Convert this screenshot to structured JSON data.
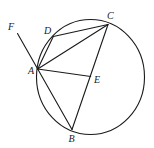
{
  "diagram": {
    "type": "geometry",
    "stroke_color": "#1a1a1a",
    "circle": {
      "cx": 90.5,
      "cy": 77,
      "rx": 54,
      "ry": 57.5
    },
    "points": {
      "A": {
        "label": "A",
        "x": 37.7,
        "y": 69,
        "lx": 28,
        "ly": 74
      },
      "B": {
        "label": "B",
        "x": 72,
        "y": 129.5,
        "lx": 68.5,
        "ly": 142
      },
      "C": {
        "label": "C",
        "x": 108,
        "y": 24.5,
        "lx": 107,
        "ly": 19
      },
      "D": {
        "label": "D",
        "x": 53.3,
        "y": 36.5,
        "lx": 44,
        "ly": 34
      },
      "E": {
        "label": "E",
        "x": 90.7,
        "y": 76.5,
        "lx": 94,
        "ly": 83
      },
      "F": {
        "label": "F",
        "x": 17.5,
        "y": 33.5,
        "lx": 8,
        "ly": 30
      }
    },
    "segments": [
      [
        "F",
        "A"
      ],
      [
        "A",
        "D"
      ],
      [
        "D",
        "C"
      ],
      [
        "A",
        "C"
      ],
      [
        "A",
        "E"
      ],
      [
        "A",
        "B"
      ],
      [
        "B",
        "C"
      ]
    ]
  }
}
